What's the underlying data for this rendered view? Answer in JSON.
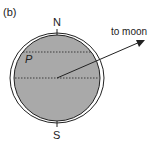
{
  "figure": {
    "panel_label": "(b)",
    "north_label": "N",
    "south_label": "S",
    "point_label": "P",
    "arrow_label": "to moon"
  },
  "colors": {
    "earth_fill": "#a9a9a9",
    "stroke": "#222222",
    "background": "#ffffff"
  }
}
